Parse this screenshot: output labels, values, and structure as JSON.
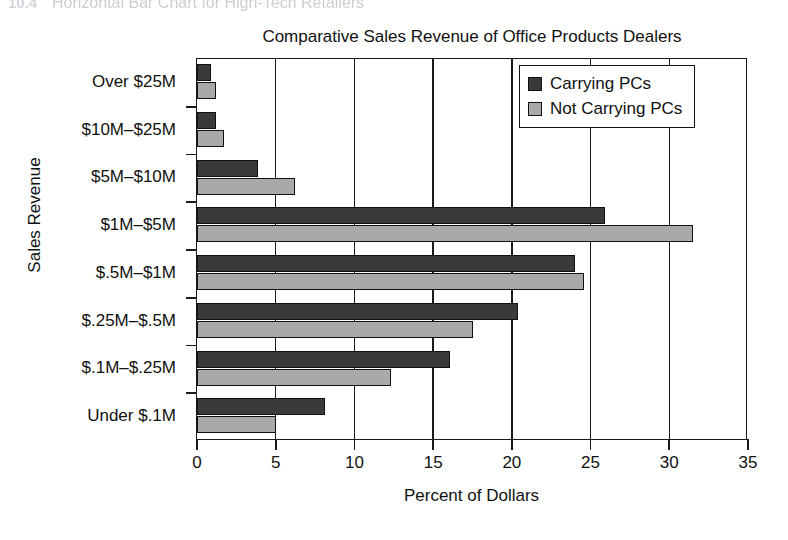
{
  "page_header": {
    "number": "10.4",
    "title": "Horizontal Bar Chart for High-Tech Retailers"
  },
  "chart_data": {
    "type": "bar",
    "orientation": "horizontal",
    "title": "Comparative Sales Revenue of Office Products Dealers",
    "xlabel": "Percent of Dollars",
    "ylabel": "Sales Revenue",
    "categories": [
      "Over $25M",
      "$10M–$25M",
      "$5M–$10M",
      "$1M–$5M",
      "$.5M–$1M",
      "$.25M–$.5M",
      "$.1M–$.25M",
      "Under $.1M"
    ],
    "series": [
      {
        "name": "Carrying PCs",
        "color": "#3a3a3a",
        "values": [
          0.9,
          1.2,
          3.9,
          25.9,
          24.0,
          20.4,
          16.1,
          8.1
        ]
      },
      {
        "name": "Not Carrying PCs",
        "color": "#a9a9a9",
        "values": [
          1.2,
          1.7,
          6.2,
          31.5,
          24.6,
          17.5,
          12.3,
          5.0
        ]
      }
    ],
    "xlim": [
      0,
      35
    ],
    "xticks": [
      0,
      5,
      10,
      15,
      20,
      25,
      30,
      35
    ],
    "xtick_labels": [
      "0",
      "5",
      "10",
      "15",
      "20",
      "25",
      "30",
      "35"
    ],
    "grid": "vertical",
    "legend_position": "top-right"
  }
}
